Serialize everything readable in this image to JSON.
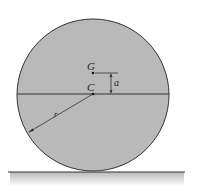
{
  "diagram": {
    "type": "rolling-disk-free-body",
    "labels": {
      "center_of_mass": "G",
      "geometric_center": "C",
      "offset": "a",
      "radius": "r"
    },
    "colors": {
      "disk_fill": "#b9b9b9",
      "outline": "#333333",
      "ground_shadow": "#c8c8c8",
      "background": "#ffffff"
    }
  }
}
